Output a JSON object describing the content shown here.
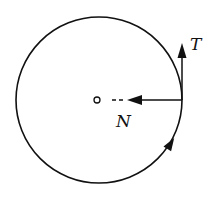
{
  "diagram": {
    "labels": {
      "tangential_force": "T",
      "normal_force": "N"
    },
    "colors": {
      "stroke": "#111111",
      "background": "#ffffff"
    },
    "elements": [
      {
        "name": "circle-path",
        "type": "circle"
      },
      {
        "name": "center-point",
        "type": "small-circle"
      },
      {
        "name": "normal-force-arrow",
        "direction": "toward center",
        "label": "N"
      },
      {
        "name": "tangential-force-arrow",
        "direction": "up (tangent)",
        "label": "T"
      },
      {
        "name": "motion-direction-arrow",
        "direction": "counterclockwise"
      }
    ]
  }
}
